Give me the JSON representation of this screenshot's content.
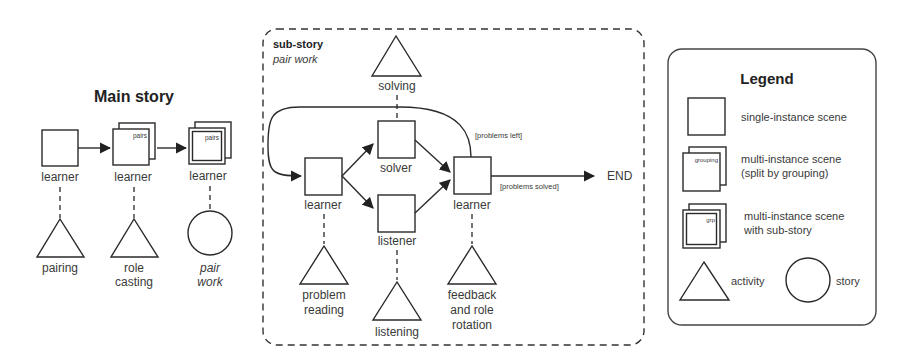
{
  "main_story": {
    "title": "Main story",
    "scenes": [
      {
        "role": "learner",
        "type": "single",
        "activity": "pairing",
        "activity_type": "activity"
      },
      {
        "role": "learner",
        "type": "multi",
        "grouping": "pairs",
        "activity_line1": "role",
        "activity_line2": "casting",
        "activity_type": "activity"
      },
      {
        "role": "learner",
        "type": "multi-substory",
        "grouping": "pairs",
        "activity_line1": "pair",
        "activity_line2": "work",
        "activity_type": "story"
      }
    ]
  },
  "sub_story": {
    "title": "sub-story",
    "subtitle": "pair work",
    "scenes": {
      "learner_start": {
        "role": "learner",
        "activity_line1": "problem",
        "activity_line2": "reading"
      },
      "solver": {
        "role": "solver",
        "activity": "solving"
      },
      "listener": {
        "role": "listener",
        "activity": "listening"
      },
      "learner_end": {
        "role": "learner",
        "activity_line1": "feedback",
        "activity_line2": "and role",
        "activity_line3": "rotation"
      }
    },
    "conditions": {
      "loop": "[problems left]",
      "exit": "[problems solved]"
    },
    "end_label": "END"
  },
  "legend": {
    "title": "Legend",
    "items": [
      {
        "shape": "single",
        "label": "single-instance scene"
      },
      {
        "shape": "multi",
        "tag": "grouping",
        "label_line1": "multi-instance scene",
        "label_line2": "(split by grouping)"
      },
      {
        "shape": "multi-substory",
        "tag": "grp",
        "label_line1": "multi-instance scene",
        "label_line2": "with sub-story"
      },
      {
        "shape": "triangle",
        "label": "activity"
      },
      {
        "shape": "circle",
        "label": "story"
      }
    ]
  }
}
